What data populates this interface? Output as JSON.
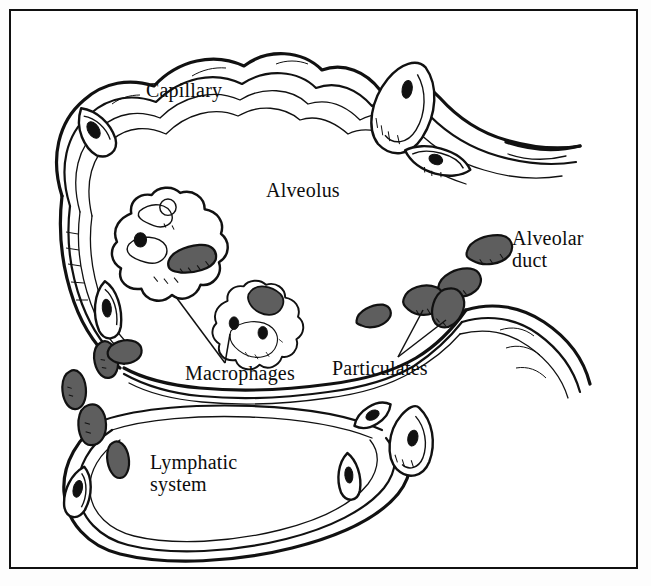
{
  "figure": {
    "type": "anatomical-line-diagram",
    "frame": {
      "visible": true,
      "color": "#111111"
    },
    "palette": {
      "background": "#ffffff",
      "ink": "#111111",
      "particulate_fill": "#5e5e5e",
      "nucleus_fill": "#111111",
      "cell_fill": "#ffffff"
    }
  },
  "labels": {
    "capillary": "Capillary",
    "alveolus": "Alveolus",
    "alveolar_duct_line1": "Alveolar",
    "alveolar_duct_line2": "duct",
    "macrophages": "Macrophages",
    "particulates": "Particulates",
    "lymphatic_line1": "Lymphatic",
    "lymphatic_line2": "system"
  },
  "structures": {
    "alveolar_wall": {
      "name": "alveolar-capillary-wall",
      "description": "C-shaped multi-contour wall enclosing the alveolar air space, open toward the alveolar duct on the right"
    },
    "capillary": {
      "name": "capillary",
      "description": "Banded vessel running along the upper and left alveolar wall"
    },
    "alveolar_duct": {
      "name": "alveolar-duct",
      "description": "Opening at the right of the alveolus leading to the duct"
    },
    "lymphatic_system": {
      "name": "lymphatic-vessel",
      "description": "Double-walled vessel loop along the lower border of the alveolus"
    },
    "epithelial_cells": [
      {
        "id": "cell-top-left",
        "cx": 96,
        "cy": 132,
        "rx": 17,
        "ry": 27,
        "rot": -32
      },
      {
        "id": "cell-top-right",
        "cx": 404,
        "cy": 108,
        "rx": 32,
        "ry": 46,
        "rot": 28
      },
      {
        "id": "cell-right-upper",
        "cx": 437,
        "cy": 162,
        "rx": 33,
        "ry": 19,
        "rot": 20
      },
      {
        "id": "cell-left-middle",
        "cx": 108,
        "cy": 310,
        "rx": 15,
        "ry": 28,
        "rot": -6
      },
      {
        "id": "cell-lower-right",
        "cx": 373,
        "cy": 416,
        "rx": 20,
        "ry": 13,
        "rot": -28
      },
      {
        "id": "cell-duct-mouth",
        "cx": 412,
        "cy": 442,
        "rx": 22,
        "ry": 34,
        "rot": 12
      },
      {
        "id": "cell-bottom-inner",
        "cx": 349,
        "cy": 477,
        "rx": 12,
        "ry": 23,
        "rot": -4
      },
      {
        "id": "cell-lymph-left",
        "cx": 78,
        "cy": 492,
        "rx": 14,
        "ry": 25,
        "rot": 14
      }
    ],
    "macrophages": [
      {
        "id": "macrophage-upper",
        "cx": 170,
        "cy": 248,
        "nucleus": {
          "cx": 150,
          "cy": 243,
          "r": 7
        },
        "engulfed_particle": {
          "cx": 192,
          "cy": 259,
          "rx": 24,
          "ry": 12,
          "rot": -14
        }
      },
      {
        "id": "macrophage-lower",
        "cx": 258,
        "cy": 328,
        "nucleus": {
          "cx": 248,
          "cy": 334,
          "r": 6
        },
        "engulfed_particle": {
          "cx": 264,
          "cy": 300,
          "rx": 17,
          "ry": 13,
          "rot": 20
        }
      }
    ],
    "particulates": [
      {
        "id": "particulate-1",
        "cx": 490,
        "cy": 250,
        "rx": 23,
        "ry": 14,
        "rot": -12
      },
      {
        "id": "particulate-2",
        "cx": 460,
        "cy": 283,
        "rx": 22,
        "ry": 14,
        "rot": -16
      },
      {
        "id": "particulate-3",
        "cx": 424,
        "cy": 300,
        "rx": 20,
        "ry": 15,
        "rot": -8
      },
      {
        "id": "particulate-4",
        "cx": 448,
        "cy": 309,
        "rx": 15,
        "ry": 20,
        "rot": 14
      },
      {
        "id": "particulate-5",
        "cx": 374,
        "cy": 316,
        "rx": 18,
        "ry": 11,
        "rot": -18
      },
      {
        "id": "particulate-6",
        "cx": 106,
        "cy": 360,
        "rx": 11,
        "ry": 18,
        "rot": -16
      },
      {
        "id": "particulate-7",
        "cx": 124,
        "cy": 352,
        "rx": 16,
        "ry": 12,
        "rot": -10
      },
      {
        "id": "particulate-8",
        "cx": 74,
        "cy": 390,
        "rx": 11,
        "ry": 19,
        "rot": -10
      },
      {
        "id": "particulate-9",
        "cx": 92,
        "cy": 425,
        "rx": 13,
        "ry": 20,
        "rot": -6
      },
      {
        "id": "particulate-10",
        "cx": 118,
        "cy": 460,
        "rx": 10,
        "ry": 18,
        "rot": -14
      }
    ],
    "leader_lines": [
      {
        "id": "leader-macrophage-upper",
        "from": [
          225,
          363
        ],
        "to": [
          176,
          297
        ]
      },
      {
        "id": "leader-macrophage-lower",
        "from": [
          225,
          363
        ],
        "to": [
          230,
          334
        ]
      },
      {
        "id": "leader-particulate-a",
        "from": [
          398,
          357
        ],
        "to": [
          423,
          310
        ]
      },
      {
        "id": "leader-particulate-b",
        "from": [
          398,
          357
        ],
        "to": [
          446,
          320
        ]
      }
    ]
  },
  "label_positions": {
    "capillary": {
      "x": 146,
      "y": 80
    },
    "alveolus": {
      "x": 266,
      "y": 180
    },
    "alveolar_duct": {
      "x": 512,
      "y": 228
    },
    "macrophages": {
      "x": 185,
      "y": 363
    },
    "particulates": {
      "x": 332,
      "y": 358
    },
    "lymphatic": {
      "x": 150,
      "y": 452
    }
  }
}
